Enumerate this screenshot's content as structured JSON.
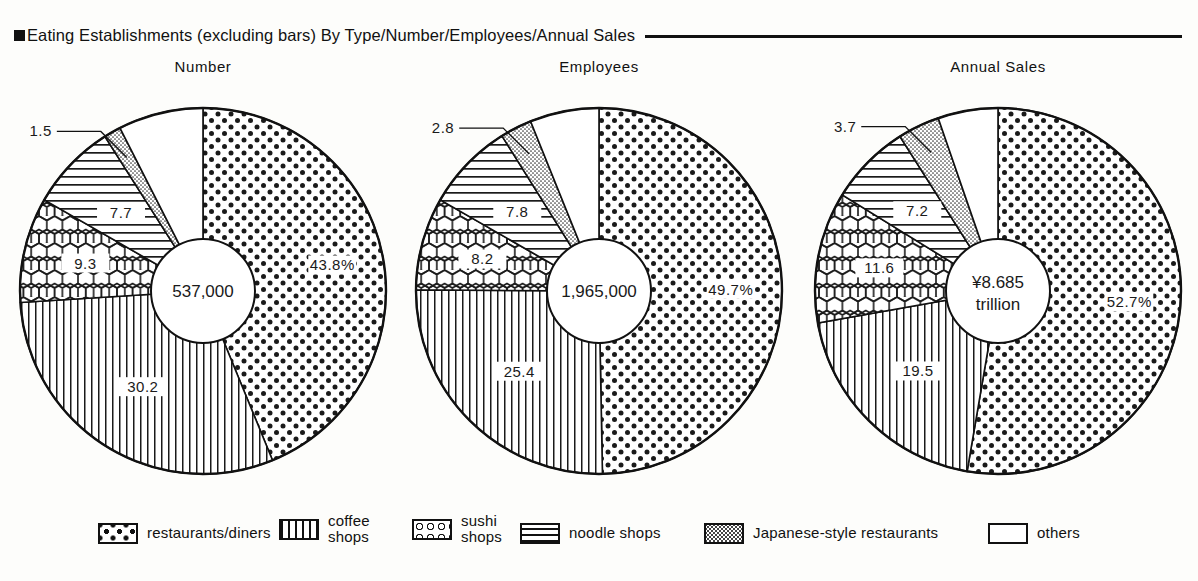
{
  "header": {
    "bullet_icon": "square-bullet-icon",
    "title": "Eating Establishments (excluding bars) By Type/Number/Employees/Annual Sales",
    "rule": true
  },
  "legend": {
    "items": [
      {
        "label": "restaurants/diners",
        "pattern": "coarse-dots",
        "name": "legend-restaurants-diners"
      },
      {
        "label": "coffee shops",
        "pattern": "vertical-lines",
        "name": "legend-coffee-shops"
      },
      {
        "label": "sushi shops",
        "pattern": "honeycomb",
        "name": "legend-sushi-shops"
      },
      {
        "label": "noodle shops",
        "pattern": "horizontal-lines",
        "name": "legend-noodle-shops"
      },
      {
        "label": "Japanese-style restaurants",
        "pattern": "fine-stipple",
        "name": "legend-japanese-style-restaurants"
      },
      {
        "label": "others",
        "pattern": "blank",
        "name": "legend-others"
      }
    ]
  },
  "chart_data": [
    {
      "type": "pie",
      "title": "Number",
      "center_label": "537,000",
      "center_label_line2": "",
      "unit": "establishments",
      "categories": [
        "restaurants/diners",
        "coffee shops",
        "sushi shops",
        "noodle shops",
        "Japanese-style restaurants",
        "others"
      ],
      "values": [
        43.8,
        30.2,
        9.3,
        7.7,
        1.5,
        7.5
      ],
      "value_labels": [
        "43.8%",
        "30.2",
        "9.3",
        "7.7",
        "1.5",
        ""
      ],
      "patterns": [
        "coarse-dots",
        "vertical-lines",
        "honeycomb",
        "horizontal-lines",
        "fine-stipple",
        "blank"
      ],
      "leader_label": "1.5",
      "ylabel": "",
      "xlabel": ""
    },
    {
      "type": "pie",
      "title": "Employees",
      "center_label": "1,965,000",
      "center_label_line2": "",
      "unit": "employees",
      "categories": [
        "restaurants/diners",
        "coffee shops",
        "sushi shops",
        "noodle shops",
        "Japanese-style restaurants",
        "others"
      ],
      "values": [
        49.7,
        25.4,
        8.2,
        7.8,
        2.8,
        6.1
      ],
      "value_labels": [
        "49.7%",
        "25.4",
        "8.2",
        "7.8",
        "2.8",
        ""
      ],
      "patterns": [
        "coarse-dots",
        "vertical-lines",
        "honeycomb",
        "horizontal-lines",
        "fine-stipple",
        "blank"
      ],
      "leader_label": "2.8",
      "ylabel": "",
      "xlabel": ""
    },
    {
      "type": "pie",
      "title": "Annual Sales",
      "center_label": "¥8.685",
      "center_label_line2": "trillion",
      "unit": "yen",
      "categories": [
        "restaurants/diners",
        "coffee shops",
        "sushi shops",
        "noodle shops",
        "Japanese-style restaurants",
        "others"
      ],
      "values": [
        52.7,
        19.5,
        11.6,
        7.2,
        3.7,
        5.3
      ],
      "value_labels": [
        "52.7%",
        "19.5",
        "11.6",
        "7.2",
        "3.7",
        ""
      ],
      "patterns": [
        "coarse-dots",
        "vertical-lines",
        "honeycomb",
        "horizontal-lines",
        "fine-stipple",
        "blank"
      ],
      "leader_label": "3.7",
      "ylabel": "",
      "xlabel": ""
    }
  ]
}
